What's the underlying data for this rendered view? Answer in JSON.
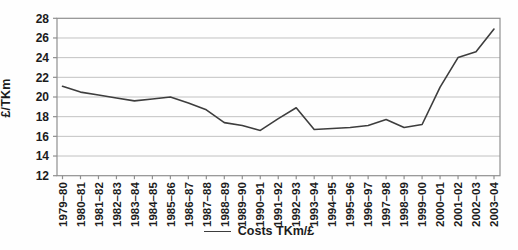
{
  "page": {
    "background": "#fefefe",
    "text_color": "#1c1c1c"
  },
  "chart_data": {
    "type": "line",
    "title": "",
    "xlabel": "",
    "ylabel": "£/TKm",
    "legend": {
      "position": "bottom-center",
      "label": "Costs TKm/£"
    },
    "grid": true,
    "ylim": [
      12,
      28
    ],
    "yticks": [
      12,
      14,
      16,
      18,
      20,
      22,
      24,
      26,
      28
    ],
    "categories": [
      "1979–80",
      "1980–81",
      "1981–82",
      "1982–83",
      "1983–84",
      "1984–85",
      "1985–86",
      "1986–87",
      "1987–88",
      "1988–89",
      "1989–90",
      "1990–91",
      "1991–92",
      "1992–93",
      "1993–94",
      "1994–95",
      "1995–96",
      "1996–97",
      "1997–98",
      "1998–99",
      "1999–00",
      "2000–01",
      "2001–02",
      "2002–03",
      "2003–04"
    ],
    "series": [
      {
        "name": "Costs TKm/£",
        "values": [
          21.1,
          20.5,
          20.2,
          19.9,
          19.6,
          19.8,
          20.0,
          19.4,
          18.7,
          17.4,
          17.1,
          16.6,
          17.8,
          18.9,
          16.7,
          16.8,
          16.9,
          17.1,
          17.7,
          16.9,
          17.2,
          21.0,
          24.0,
          24.6,
          26.9
        ]
      }
    ],
    "colors": {
      "line": "#3d3d3d",
      "grid": "#c2c2c2",
      "axis": "#8f8f8f",
      "text": "#1c1c1c"
    }
  }
}
